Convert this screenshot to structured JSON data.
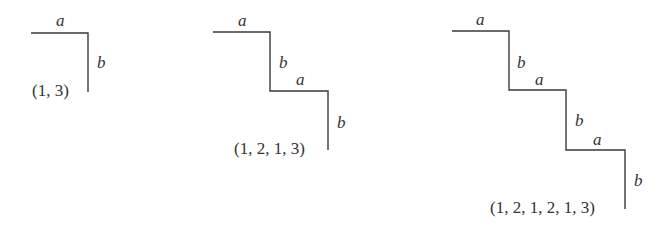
{
  "figure": {
    "diagrams": [
      {
        "id": "staircase-1",
        "steps": 1,
        "labels": {
          "a1": "a",
          "b1": "b"
        },
        "tuple": "(1, 3)"
      },
      {
        "id": "staircase-2",
        "steps": 2,
        "labels": {
          "a1": "a",
          "b1": "b",
          "a2": "a",
          "b2": "b"
        },
        "tuple": "(1, 2, 1, 3)"
      },
      {
        "id": "staircase-3",
        "steps": 3,
        "labels": {
          "a1": "a",
          "b1": "b",
          "a2": "a",
          "b2": "b",
          "a3": "a",
          "b3": "b"
        },
        "tuple": "(1, 2, 1, 2, 1, 3)"
      }
    ],
    "colors": {
      "stroke": "#3a3a3a",
      "text": "#333333",
      "background": "#ffffff"
    }
  }
}
